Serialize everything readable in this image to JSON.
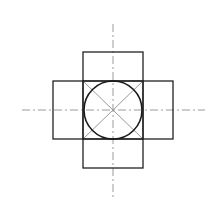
{
  "diagram": {
    "type": "cross-shaped net of rectangles with inscribed circle",
    "colors": {
      "background": "#ffffff",
      "outline": "#222222",
      "construction": "#999999",
      "centerline": "#9a9a9a"
    },
    "center": {
      "x": 113,
      "y": 110
    },
    "central_square": {
      "x": 83,
      "y": 81,
      "w": 60,
      "h": 58
    },
    "top_rect": {
      "x": 83,
      "y": 52,
      "w": 60,
      "h": 29
    },
    "bottom_rect": {
      "x": 83,
      "y": 139,
      "w": 60,
      "h": 29
    },
    "left_rect": {
      "x": 53,
      "y": 81,
      "w": 30,
      "h": 58
    },
    "right_rect": {
      "x": 143,
      "y": 81,
      "w": 30,
      "h": 58
    },
    "circle": {
      "cx": 113,
      "cy": 110,
      "r": 29
    },
    "horizontal_centerline": {
      "x1": 22,
      "x2": 205,
      "y": 110
    },
    "vertical_centerline": {
      "y1": 24,
      "y2": 198,
      "x": 113
    }
  }
}
